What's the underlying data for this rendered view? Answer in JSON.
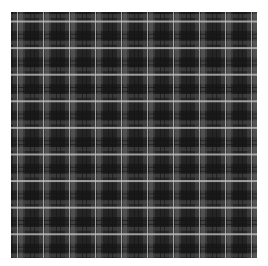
{
  "image": {
    "subject": "gray plaid tartan fabric pattern",
    "colors": {
      "base": "#3b3b3b",
      "dark_block": "#222222",
      "band": "#787878",
      "bright_line": "#c8c8c8",
      "background": "#ffffff"
    },
    "repeat_px": 26
  }
}
